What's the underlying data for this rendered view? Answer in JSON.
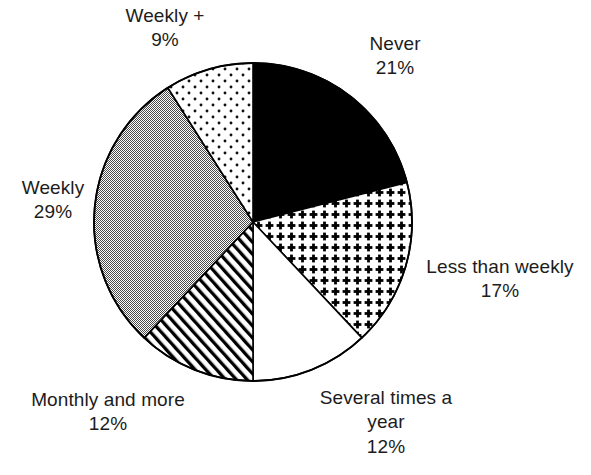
{
  "chart_data": {
    "type": "pie",
    "title": "",
    "subtitle": "",
    "xlabel": "",
    "ylabel": "",
    "legend_position": "none",
    "grid": false,
    "units": "%",
    "start_angle_deg": 0,
    "direction": "clockwise",
    "total": 100,
    "categories": [
      "Never",
      "Less than weekly",
      "Several times a year",
      "Monthly and more",
      "Weekly",
      "Weekly +"
    ],
    "values": [
      21,
      17,
      12,
      12,
      29,
      9
    ],
    "slices": [
      {
        "label": "Never",
        "value": 21,
        "value_text": "21%",
        "fill": "solid-black",
        "color": "#000000",
        "start_deg": 0,
        "end_deg": 75.6
      },
      {
        "label": "Less than weekly",
        "value": 17,
        "value_text": "17%",
        "fill": "dense-cross-dots",
        "color": "#ffffff",
        "start_deg": 75.6,
        "end_deg": 136.8
      },
      {
        "label": "Several times a year",
        "value": 12,
        "value_text": "12%",
        "fill": "blank-white",
        "color": "#ffffff",
        "start_deg": 136.8,
        "end_deg": 180.0
      },
      {
        "label": "Monthly and more",
        "value": 12,
        "value_text": "12%",
        "fill": "diagonal-hatch",
        "color": "#ffffff",
        "start_deg": 180.0,
        "end_deg": 223.2
      },
      {
        "label": "Weekly",
        "value": 29,
        "value_text": "29%",
        "fill": "gray-dither",
        "color": "#969696",
        "start_deg": 223.2,
        "end_deg": 327.6
      },
      {
        "label": "Weekly +",
        "value": 9,
        "value_text": "9%",
        "fill": "sparse-dots",
        "color": "#ffffff",
        "start_deg": 327.6,
        "end_deg": 360.0
      }
    ]
  },
  "labels": {
    "never": {
      "title": "Never",
      "pct": "21%"
    },
    "less_than_weekly": {
      "title": "Less than weekly",
      "pct": "17%"
    },
    "several_times_a_year": {
      "line1": "Several times a",
      "line2": "year",
      "pct": "12%"
    },
    "monthly_and_more": {
      "title": "Monthly and more",
      "pct": "12%"
    },
    "weekly": {
      "title": "Weekly",
      "pct": "29%"
    },
    "weekly_plus": {
      "title": "Weekly +",
      "pct": "9%"
    }
  },
  "style": {
    "outline_color": "#000000",
    "gray_fill": "#969696",
    "background": "#ffffff",
    "text_color": "#1c1c1c"
  }
}
